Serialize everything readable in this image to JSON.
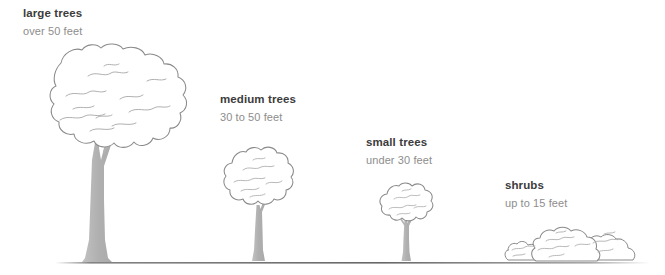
{
  "diagram": {
    "background_color": "#ffffff",
    "outline_color": "#8a8a8a",
    "detail_color": "#b8b8b8",
    "trunk_color": "#b3b3b3",
    "ground_color": "#6e6e6e",
    "title_color": "#3c3c3c",
    "subtitle_color": "#8d8d8d"
  },
  "categories": [
    {
      "key": "large",
      "title": "large trees",
      "subtitle": "over 50 feet",
      "icon": "large-tree-icon"
    },
    {
      "key": "medium",
      "title": "medium trees",
      "subtitle": "30 to 50 feet",
      "icon": "medium-tree-icon"
    },
    {
      "key": "small",
      "title": "small trees",
      "subtitle": "under 30 feet",
      "icon": "small-tree-icon"
    },
    {
      "key": "shrubs",
      "title": "shrubs",
      "subtitle": "up to 15 feet",
      "icon": "shrub-cluster-icon"
    }
  ],
  "ground": {
    "name": "ground-line"
  }
}
